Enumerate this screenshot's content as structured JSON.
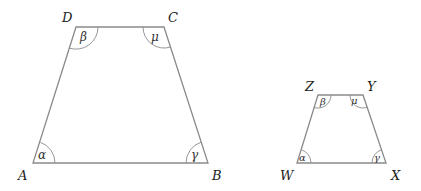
{
  "figure": {
    "colors": {
      "stroke": "#8a8a8a",
      "text": "#222222",
      "background": "#ffffff"
    },
    "large_trapezoid": {
      "vertices": {
        "A": "A",
        "B": "B",
        "C": "C",
        "D": "D"
      },
      "angles": {
        "A": "α",
        "B": "γ",
        "C": "μ",
        "D": "β"
      }
    },
    "small_trapezoid": {
      "vertices": {
        "W": "W",
        "X": "X",
        "Y": "Y",
        "Z": "Z"
      },
      "angles": {
        "W": "α",
        "X": "γ",
        "Y": "μ",
        "Z": "β"
      }
    }
  }
}
